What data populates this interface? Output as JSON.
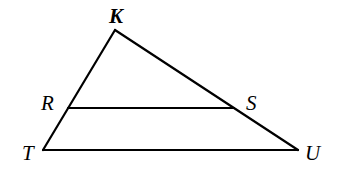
{
  "diagram": {
    "type": "geometry-triangle",
    "points": {
      "K": {
        "label": "K",
        "x": 115,
        "y": 30
      },
      "R": {
        "label": "R",
        "x": 68,
        "y": 108
      },
      "S": {
        "label": "S",
        "x": 234,
        "y": 108
      },
      "T": {
        "label": "T",
        "x": 43,
        "y": 150
      },
      "U": {
        "label": "U",
        "x": 298,
        "y": 150
      }
    },
    "segments": [
      {
        "from": "K",
        "to": "T"
      },
      {
        "from": "K",
        "to": "U"
      },
      {
        "from": "T",
        "to": "U"
      },
      {
        "from": "R",
        "to": "S"
      }
    ],
    "labels": {
      "K": "K",
      "R": "R",
      "S": "S",
      "T": "T",
      "U": "U"
    },
    "colors": {
      "line": "#000000",
      "background": "#ffffff"
    }
  }
}
